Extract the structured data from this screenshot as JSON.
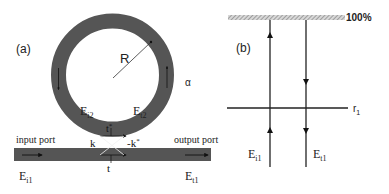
{
  "panel_a": {
    "label": "(a)",
    "radius_label": "R",
    "loss_label": "α",
    "field_i2": {
      "base": "E",
      "sub": "i2"
    },
    "field_t2": {
      "base": "E",
      "sub": "t2"
    },
    "coupling_t_star": {
      "base": "t",
      "sup": "*"
    },
    "coupling_k": "k",
    "coupling_k_star": {
      "base": "-k",
      "sup": "*"
    },
    "coupling_t": "t",
    "input_port": "input port",
    "output_port": "output port",
    "field_i1": {
      "base": "E",
      "sub": "i1"
    },
    "field_t1": {
      "base": "E",
      "sub": "t1"
    }
  },
  "panel_b": {
    "label": "(b)",
    "mirror_label": "100%",
    "reflector_label": {
      "base": "r",
      "sub": "1"
    },
    "field_i1": {
      "base": "E",
      "sub": "i1"
    },
    "field_t1": {
      "base": "E",
      "sub": "t1"
    }
  },
  "colors": {
    "waveguide": "#555555",
    "line": "#222222",
    "text": "#222222",
    "hatch": "#888888"
  }
}
